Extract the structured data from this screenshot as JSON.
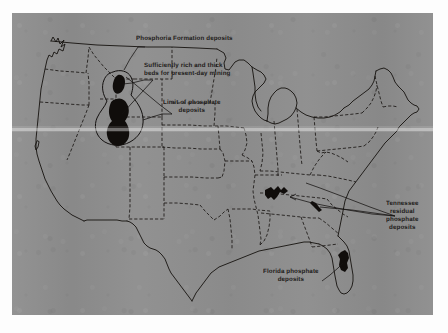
{
  "figure": {
    "kind": "printed-map",
    "plate_background_color": "#8d8d8d",
    "ink_color": "#15120f",
    "page_background_color": "#fdfdfd"
  },
  "annotations": [
    {
      "id": "phosphoria",
      "name": "phosphoria-formation-label",
      "text": "Phosphoria Formation deposits",
      "lines": [
        "Phosphoria Formation deposits"
      ],
      "x": 136,
      "y": 35,
      "align": "left"
    },
    {
      "id": "sufficiently-rich",
      "name": "sufficiently-rich-beds-label",
      "text": "Sufficiently rich and thick beds for present-day mining",
      "lines": [
        "Sufficiently rich and thick",
        "beds for present-day mining"
      ],
      "x": 144,
      "y": 62,
      "align": "left"
    },
    {
      "id": "limit-of-phosphate",
      "name": "limit-of-phosphate-deposits-label",
      "text": "Limit of phosphate deposits",
      "lines": [
        "Limit of phosphate",
        "deposits"
      ],
      "x": 163,
      "y": 99,
      "align": "left"
    },
    {
      "id": "tennessee",
      "name": "tennessee-residual-phosphate-label",
      "text": "Tennessee residual phosphate deposits",
      "lines": [
        "Tennessee",
        "residual",
        "phosphate",
        "deposits"
      ],
      "x": 386,
      "y": 200,
      "align": "left"
    },
    {
      "id": "florida",
      "name": "florida-phosphate-deposits-label",
      "text": "Florida phosphate deposits",
      "lines": [
        "Florida phosphate",
        "deposits"
      ],
      "x": 263,
      "y": 268,
      "align": "left"
    }
  ],
  "deposit_regions": [
    {
      "id": "western-upper",
      "name": "western-phosphoria-upper-deposit"
    },
    {
      "id": "western-lower",
      "name": "western-phosphoria-lower-deposit"
    },
    {
      "id": "tennessee-central",
      "name": "tennessee-central-deposit"
    },
    {
      "id": "tennessee-east",
      "name": "tennessee-eastern-deposit"
    },
    {
      "id": "florida-peninsula",
      "name": "florida-phosphate-deposit"
    }
  ],
  "map_features": {
    "limit_outline_name": "limit-of-phosphate-deposits-outline",
    "coastline_name": "us-coastline",
    "state_borders_name": "state-border-lines",
    "border_style": "dashed"
  }
}
